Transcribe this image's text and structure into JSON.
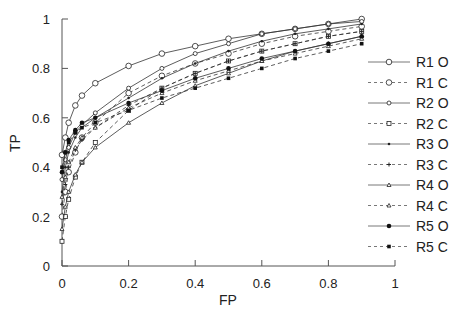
{
  "chart_data": {
    "type": "line",
    "title": "",
    "xlabel": "FP",
    "ylabel": "TP",
    "xlim": [
      0,
      1
    ],
    "ylim": [
      0,
      1
    ],
    "xticks": [
      "0",
      "0.2",
      "0.4",
      "0.6",
      "0.8",
      "1"
    ],
    "yticks": [
      "0",
      "0.2",
      "0.4",
      "0.6",
      "0.8",
      "1"
    ],
    "grid": false,
    "legend_position": "right",
    "x": [
      0.0,
      0.01,
      0.02,
      0.04,
      0.06,
      0.1,
      0.2,
      0.3,
      0.4,
      0.5,
      0.6,
      0.7,
      0.8,
      0.9
    ],
    "series": [
      {
        "name": "R1 O",
        "style": "solid",
        "marker": "open-circle-large",
        "values": [
          0.45,
          0.52,
          0.58,
          0.65,
          0.69,
          0.74,
          0.81,
          0.86,
          0.89,
          0.92,
          0.94,
          0.96,
          0.98,
          1.0
        ]
      },
      {
        "name": "R1 C",
        "style": "dashed",
        "marker": "open-circle-large",
        "values": [
          0.2,
          0.3,
          0.38,
          0.46,
          0.52,
          0.58,
          0.7,
          0.77,
          0.82,
          0.86,
          0.9,
          0.93,
          0.95,
          0.97
        ]
      },
      {
        "name": "R2 O",
        "style": "solid",
        "marker": "open-circle-small",
        "values": [
          0.35,
          0.43,
          0.48,
          0.54,
          0.57,
          0.62,
          0.72,
          0.8,
          0.86,
          0.9,
          0.94,
          0.96,
          0.98,
          0.99
        ]
      },
      {
        "name": "R2 C",
        "style": "dashed",
        "marker": "open-square",
        "values": [
          0.1,
          0.2,
          0.27,
          0.36,
          0.42,
          0.5,
          0.63,
          0.72,
          0.78,
          0.83,
          0.87,
          0.9,
          0.93,
          0.95
        ]
      },
      {
        "name": "R3 O",
        "style": "solid",
        "marker": "small-dot",
        "values": [
          0.3,
          0.4,
          0.46,
          0.52,
          0.56,
          0.6,
          0.68,
          0.76,
          0.82,
          0.87,
          0.91,
          0.94,
          0.96,
          0.98
        ]
      },
      {
        "name": "R3 C",
        "style": "dashed",
        "marker": "small-plus",
        "values": [
          0.25,
          0.33,
          0.4,
          0.47,
          0.51,
          0.56,
          0.65,
          0.72,
          0.78,
          0.83,
          0.87,
          0.9,
          0.93,
          0.95
        ]
      },
      {
        "name": "R4 O",
        "style": "solid",
        "marker": "small-triangle",
        "values": [
          0.15,
          0.24,
          0.3,
          0.37,
          0.42,
          0.48,
          0.58,
          0.66,
          0.73,
          0.78,
          0.83,
          0.87,
          0.9,
          0.93
        ]
      },
      {
        "name": "R4 C",
        "style": "dashed",
        "marker": "small-triangle",
        "values": [
          0.28,
          0.36,
          0.42,
          0.48,
          0.52,
          0.56,
          0.64,
          0.7,
          0.75,
          0.79,
          0.83,
          0.86,
          0.89,
          0.92
        ]
      },
      {
        "name": "R5 O",
        "style": "solid",
        "marker": "filled-circle",
        "values": [
          0.38,
          0.46,
          0.51,
          0.55,
          0.58,
          0.6,
          0.66,
          0.71,
          0.76,
          0.8,
          0.84,
          0.87,
          0.9,
          0.93
        ]
      },
      {
        "name": "R5 C",
        "style": "dashed",
        "marker": "filled-square",
        "values": [
          0.4,
          0.46,
          0.5,
          0.54,
          0.56,
          0.58,
          0.63,
          0.68,
          0.72,
          0.76,
          0.8,
          0.84,
          0.87,
          0.9
        ]
      }
    ]
  }
}
